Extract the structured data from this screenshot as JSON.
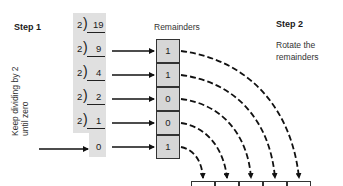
{
  "step1": {
    "title": "Step 1",
    "instruction": "Keep dividing by 2 until zero"
  },
  "step2": {
    "title": "Step 2",
    "instruction_line1": "Rotate the",
    "instruction_line2": "remainders"
  },
  "remainders_header": "Remainders",
  "divisions": [
    {
      "divisor": "2",
      "dividend": "19"
    },
    {
      "divisor": "2",
      "dividend": "9"
    },
    {
      "divisor": "2",
      "dividend": "4"
    },
    {
      "divisor": "2",
      "dividend": "2"
    },
    {
      "divisor": "2",
      "dividend": "1"
    }
  ],
  "final_quotient": "0",
  "remainders": [
    "1",
    "1",
    "0",
    "0",
    "1"
  ],
  "result_boxes_count": 5,
  "colors": {
    "grey_column": "#e0e0e0",
    "box_fill": "#d6d6d6",
    "line": "#111111"
  }
}
